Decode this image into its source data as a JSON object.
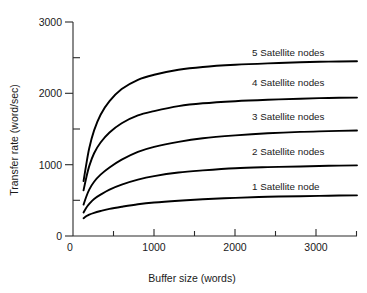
{
  "chart_data": {
    "type": "line",
    "title": "",
    "xlabel": "Buffer size (words)",
    "ylabel": "Transfer rate (word/sec)",
    "xlim": [
      0,
      3500
    ],
    "ylim": [
      0,
      3000
    ],
    "grid": false,
    "legend_position": "inline-right-of-curves",
    "x_ticks_major": [
      0,
      1000,
      2000,
      3000
    ],
    "x_tick_labels": [
      "0",
      "1000",
      "2000",
      "3000"
    ],
    "x_ticks_minor": [
      500,
      1500,
      2500,
      3500
    ],
    "y_ticks_major": [
      0,
      1000,
      2000,
      3000
    ],
    "y_tick_labels": [
      "0",
      "1000",
      "2000",
      "3000"
    ],
    "y_ticks_minor": [
      500,
      1500,
      2500
    ],
    "x": [
      130,
      160,
      200,
      260,
      340,
      450,
      600,
      800,
      1000,
      1300,
      1600,
      2000,
      2400,
      2800,
      3150,
      3500
    ],
    "series": [
      {
        "name": "5 Satellite nodes",
        "label": "5 Satellite nodes",
        "values": [
          770,
          980,
          1230,
          1480,
          1700,
          1890,
          2060,
          2190,
          2260,
          2330,
          2370,
          2400,
          2420,
          2435,
          2445,
          2450
        ]
      },
      {
        "name": "4 Satellite nodes",
        "label": "4 Satellite nodes",
        "values": [
          640,
          800,
          980,
          1160,
          1310,
          1450,
          1580,
          1690,
          1750,
          1820,
          1860,
          1890,
          1910,
          1925,
          1935,
          1940
        ]
      },
      {
        "name": "3 Satellite nodes",
        "label": "3 Satellite nodes",
        "values": [
          440,
          540,
          650,
          760,
          860,
          960,
          1070,
          1180,
          1250,
          1320,
          1370,
          1410,
          1440,
          1460,
          1470,
          1480
        ]
      },
      {
        "name": "2 Satellite nodes",
        "label": "2 Satellite nodes",
        "values": [
          330,
          390,
          450,
          520,
          580,
          650,
          720,
          790,
          840,
          890,
          920,
          950,
          965,
          975,
          985,
          990
        ]
      },
      {
        "name": "1 Satellite node",
        "label": "1 Satellite node",
        "values": [
          250,
          275,
          300,
          325,
          350,
          380,
          410,
          445,
          470,
          495,
          515,
          535,
          550,
          558,
          565,
          570
        ]
      }
    ]
  },
  "labels": {
    "y_axis_title": "Transfer rate (word/sec)",
    "x_axis_title": "Buffer size (words)",
    "y_3000": "3000",
    "y_2000": "2000",
    "y_1000": "1000",
    "y_0": "0",
    "x_0": "0",
    "x_1000": "1000",
    "x_2000": "2000",
    "x_3000": "3000",
    "series_5": "5 Satellite nodes",
    "series_4": "4 Satellite nodes",
    "series_3": "3 Satellite nodes",
    "series_2": "2 Satellite nodes",
    "series_1": "1 Satellite node"
  },
  "colors": {
    "curve": "#000000",
    "axis": "#2a2a2a",
    "text": "#1a1a1a",
    "background": "#ffffff"
  }
}
